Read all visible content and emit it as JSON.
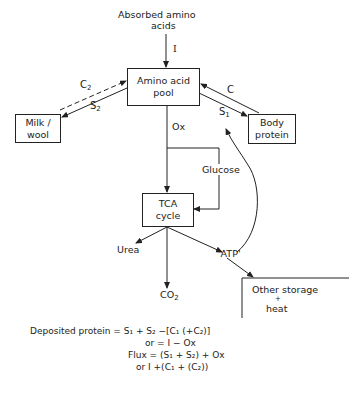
{
  "nodes": {
    "absorbed": {
      "line1": "Absorbed amino",
      "line2": "acids"
    },
    "pool": {
      "line1": "Amino acid",
      "line2": "pool"
    },
    "milk": {
      "line1": "Milk /",
      "line2": "wool"
    },
    "body": {
      "line1": "Body",
      "line2": "protein"
    },
    "tca": {
      "line1": "TCA",
      "line2": "cycle"
    },
    "storage": {
      "line1": "Other storage",
      "line2": "+",
      "line3": "heat"
    },
    "urea": "Urea",
    "co2": "CO",
    "co2_sub": "2",
    "atp": "'ATP'"
  },
  "edges": {
    "I": "I",
    "C2": "C",
    "C2_sub": "2",
    "S2": "S",
    "S2_sub": "2",
    "C": "C",
    "S1": "S",
    "S1_sub": "1",
    "Ox": "Ox",
    "glucose": "Glucose"
  },
  "equations": {
    "line1": "Deposited protein = S₁ + S₂ −[C₁ (+C₂)]",
    "line2": "or = I − Ox",
    "line3": "Flux = (S₁ + S₂) + Ox",
    "line4": "or I +(C₁ + (C₂))"
  },
  "colors": {
    "ink": "#222222",
    "background": "#ffffff"
  }
}
